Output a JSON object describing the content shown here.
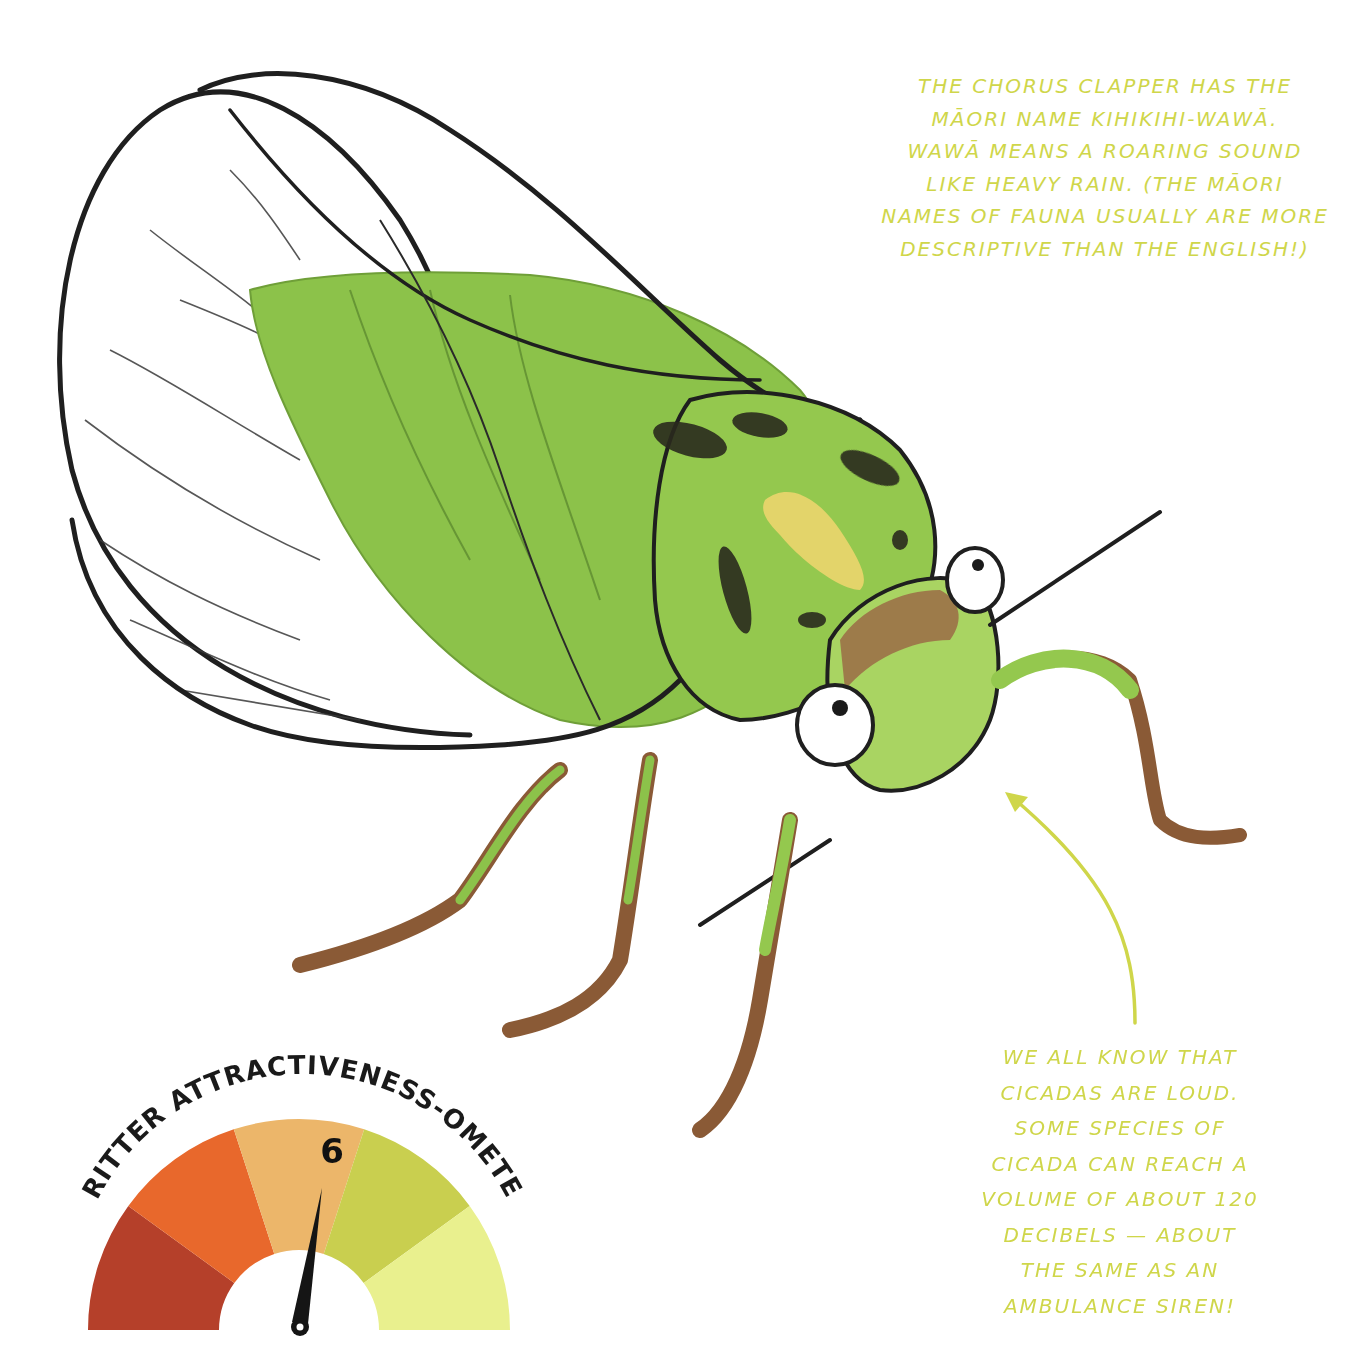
{
  "captions": {
    "top": {
      "lines": [
        "THE CHORUS CLAPPER HAS THE",
        "MĀORI NAME KIHIKIHI-WAWĀ.",
        "WAWĀ MEANS A ROARING SOUND",
        "LIKE HEAVY RAIN. (THE MĀORI",
        "NAMES OF FAUNA USUALLY ARE MORE",
        "DESCRIPTIVE THAN THE ENGLISH!)"
      ]
    },
    "bottom": {
      "lines": [
        "WE ALL KNOW THAT",
        "CICADAS ARE LOUD.",
        "SOME SPECIES OF",
        "CICADA CAN REACH A",
        "VOLUME OF ABOUT 120",
        "DECIBELS — ABOUT",
        "THE SAME AS AN",
        "AMBULANCE SIREN!"
      ]
    }
  },
  "gauge": {
    "title": "CRITTER ATTRACTIVENESS-OMETER",
    "value": "6",
    "segments": [
      {
        "color": "#b5402a"
      },
      {
        "color": "#e8682c"
      },
      {
        "color": "#ecb66a"
      },
      {
        "color": "#c9cf4f"
      },
      {
        "color": "#e9f08e"
      }
    ],
    "needle_color": "#151515"
  },
  "colors": {
    "caption_text": "#cfd64a",
    "body_green": "#8cc24a",
    "body_light_green": "#a9d462",
    "body_spots": "#2a2a1e",
    "leg_brown": "#8a5a36",
    "wing_outline": "#1f1f1f",
    "arrow": "#cfd64a"
  }
}
